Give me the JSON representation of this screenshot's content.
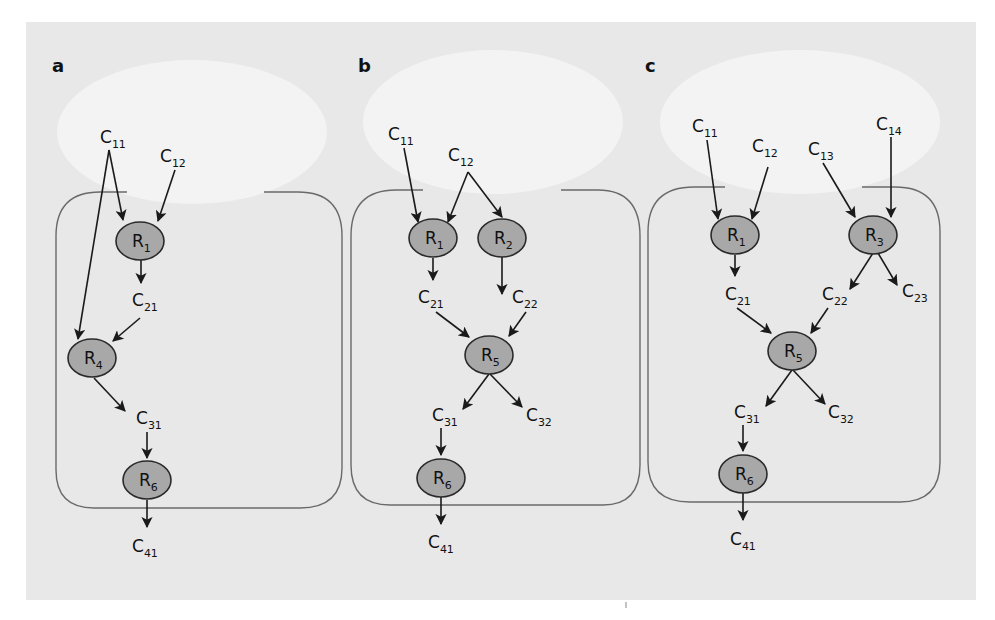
{
  "colors": {
    "background": "#e8e8e8",
    "halo": "#f3f3f3",
    "node_fill": "#a8a8a8",
    "node_stroke": "#2a2a2a",
    "edge": "#1a1a1a",
    "cell_outline": "#6a6a6a"
  },
  "panels": [
    {
      "letter": "a",
      "nodes": {
        "C11": {
          "base": "C",
          "sub": "11"
        },
        "C12": {
          "base": "C",
          "sub": "12"
        },
        "R1": {
          "base": "R",
          "sub": "1"
        },
        "C21": {
          "base": "C",
          "sub": "21"
        },
        "R4": {
          "base": "R",
          "sub": "4"
        },
        "C31": {
          "base": "C",
          "sub": "31"
        },
        "R6": {
          "base": "R",
          "sub": "6"
        },
        "C41": {
          "base": "C",
          "sub": "41"
        }
      },
      "edges": [
        [
          "C11",
          "R1"
        ],
        [
          "C11",
          "R4"
        ],
        [
          "C12",
          "R1"
        ],
        [
          "R1",
          "C21"
        ],
        [
          "C21",
          "R4"
        ],
        [
          "R4",
          "C31"
        ],
        [
          "C31",
          "R6"
        ],
        [
          "R6",
          "C41"
        ]
      ]
    },
    {
      "letter": "b",
      "nodes": {
        "C11": {
          "base": "C",
          "sub": "11"
        },
        "C12": {
          "base": "C",
          "sub": "12"
        },
        "R1": {
          "base": "R",
          "sub": "1"
        },
        "R2": {
          "base": "R",
          "sub": "2"
        },
        "C21": {
          "base": "C",
          "sub": "21"
        },
        "C22": {
          "base": "C",
          "sub": "22"
        },
        "R5": {
          "base": "R",
          "sub": "5"
        },
        "C31": {
          "base": "C",
          "sub": "31"
        },
        "C32": {
          "base": "C",
          "sub": "32"
        },
        "R6": {
          "base": "R",
          "sub": "6"
        },
        "C41": {
          "base": "C",
          "sub": "41"
        }
      },
      "edges": [
        [
          "C11",
          "R1"
        ],
        [
          "C12",
          "R1"
        ],
        [
          "C12",
          "R2"
        ],
        [
          "R1",
          "C21"
        ],
        [
          "R2",
          "C22"
        ],
        [
          "C21",
          "R5"
        ],
        [
          "C22",
          "R5"
        ],
        [
          "R5",
          "C31"
        ],
        [
          "R5",
          "C32"
        ],
        [
          "C31",
          "R6"
        ],
        [
          "R6",
          "C41"
        ]
      ]
    },
    {
      "letter": "c",
      "nodes": {
        "C11": {
          "base": "C",
          "sub": "11"
        },
        "C12": {
          "base": "C",
          "sub": "12"
        },
        "C13": {
          "base": "C",
          "sub": "13"
        },
        "C14": {
          "base": "C",
          "sub": "14"
        },
        "R1": {
          "base": "R",
          "sub": "1"
        },
        "R3": {
          "base": "R",
          "sub": "3"
        },
        "C21": {
          "base": "C",
          "sub": "21"
        },
        "C22": {
          "base": "C",
          "sub": "22"
        },
        "C23": {
          "base": "C",
          "sub": "23"
        },
        "R5": {
          "base": "R",
          "sub": "5"
        },
        "C31": {
          "base": "C",
          "sub": "31"
        },
        "C32": {
          "base": "C",
          "sub": "32"
        },
        "R6": {
          "base": "R",
          "sub": "6"
        },
        "C41": {
          "base": "C",
          "sub": "41"
        }
      },
      "edges": [
        [
          "C11",
          "R1"
        ],
        [
          "C12",
          "R1"
        ],
        [
          "C13",
          "R3"
        ],
        [
          "C14",
          "R3"
        ],
        [
          "R1",
          "C21"
        ],
        [
          "R3",
          "C22"
        ],
        [
          "R3",
          "C23"
        ],
        [
          "C21",
          "R5"
        ],
        [
          "C22",
          "R5"
        ],
        [
          "R5",
          "C31"
        ],
        [
          "R5",
          "C32"
        ],
        [
          "C31",
          "R6"
        ],
        [
          "R6",
          "C41"
        ]
      ]
    }
  ]
}
